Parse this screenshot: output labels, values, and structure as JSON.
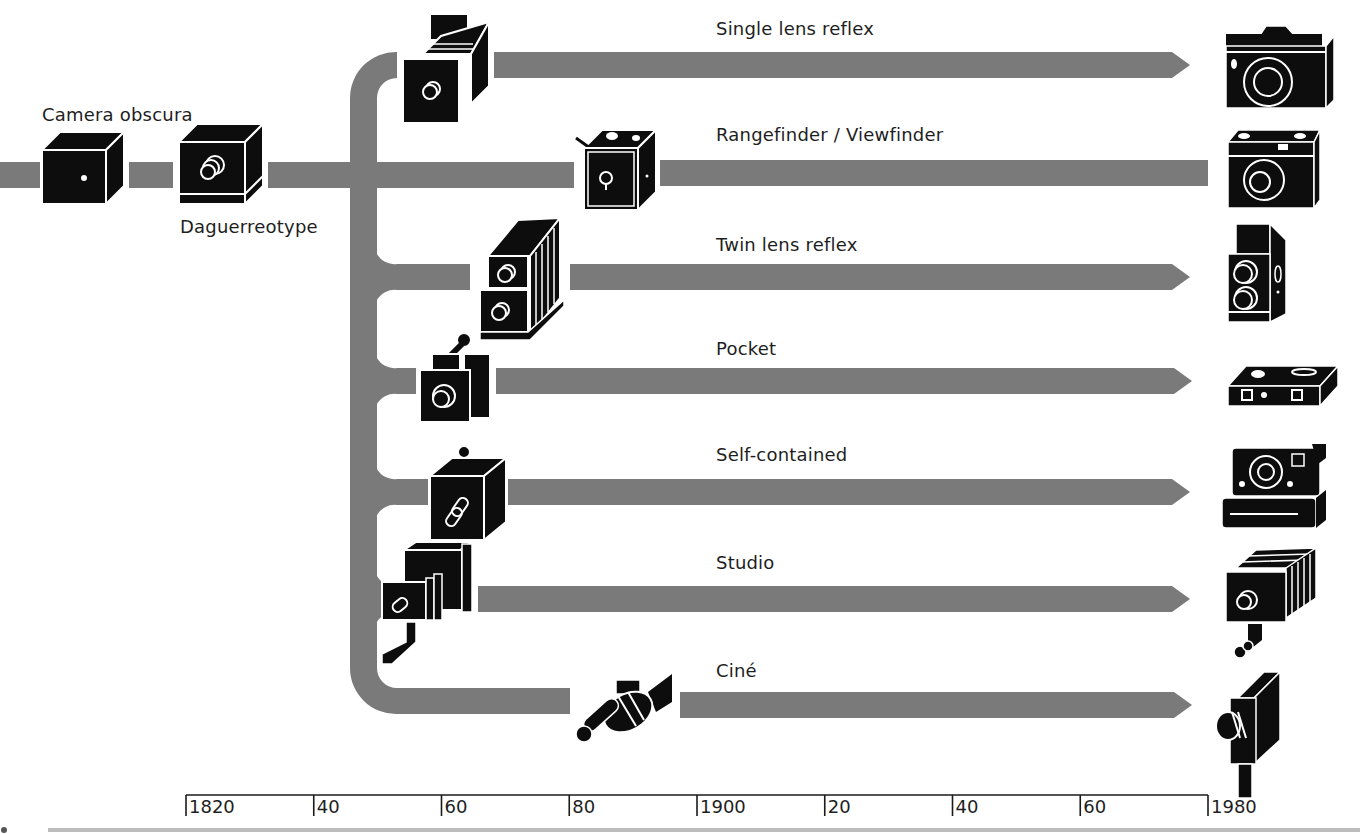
{
  "colors": {
    "track": "#7a7a7a",
    "icon": "#0d0d0d",
    "icon_line": "#ffffff",
    "text": "#1e1e1e",
    "footer_rule": "#bdbdbd"
  },
  "origins": [
    {
      "label": "Camera obscura",
      "icon": "camera-obscura-icon"
    },
    {
      "label": "Daguerreotype",
      "icon": "daguerreotype-icon"
    }
  ],
  "branches": [
    {
      "label": "Single lens reflex",
      "origin_icon": "early-reflex-camera-icon",
      "modern_icon": "slr-camera-icon",
      "start_year": 1861,
      "end_year": 1980
    },
    {
      "label": "Rangefinder / Viewfinder",
      "origin_icon": "box-camera-icon",
      "modern_icon": "rangefinder-camera-icon",
      "start_year": 1888,
      "end_year": 1980
    },
    {
      "label": "Twin lens reflex",
      "origin_icon": "early-twin-lens-camera-icon",
      "modern_icon": "twin-lens-reflex-camera-icon",
      "start_year": 1880,
      "end_year": 1980
    },
    {
      "label": "Pocket",
      "origin_icon": "early-pocket-camera-icon",
      "modern_icon": "pocket-camera-icon",
      "start_year": 1859,
      "end_year": 1980
    },
    {
      "label": "Self-contained",
      "origin_icon": "early-self-contained-camera-icon",
      "modern_icon": "instant-camera-icon",
      "start_year": 1860,
      "end_year": 1980
    },
    {
      "label": "Studio",
      "origin_icon": "early-studio-camera-icon",
      "modern_icon": "studio-camera-icon",
      "start_year": 1858,
      "end_year": 1980
    },
    {
      "label": "Ciné",
      "origin_icon": "early-cine-camera-icon",
      "modern_icon": "cine-camera-icon",
      "start_year": 1895,
      "end_year": 1980
    }
  ],
  "axis": {
    "ticks": [
      "1820",
      "40",
      "60",
      "80",
      "1900",
      "20",
      "40",
      "60",
      "1980"
    ]
  }
}
